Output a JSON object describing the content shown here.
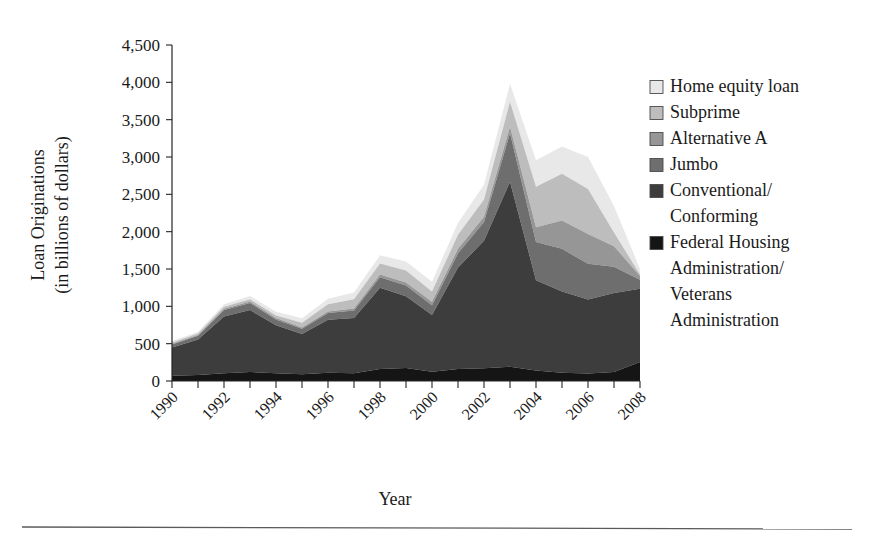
{
  "chart_data": {
    "type": "area",
    "stacked": true,
    "title": "",
    "xlabel": "Year",
    "ylabel": "Loan Originations\n(in billions of dollars)",
    "ylabel_line1": "Loan Originations",
    "ylabel_line2": "(in billions of dollars)",
    "xlim": [
      1990,
      2008
    ],
    "ylim": [
      0,
      4500
    ],
    "ytick_step": 500,
    "grid": false,
    "legend_position": "right",
    "x": [
      1990,
      1991,
      1992,
      1993,
      1994,
      1995,
      1996,
      1997,
      1998,
      1999,
      2000,
      2001,
      2002,
      2003,
      2004,
      2005,
      2006,
      2007,
      2008
    ],
    "xticks": [
      1990,
      1992,
      1994,
      1996,
      1998,
      2000,
      2002,
      2004,
      2006,
      2008
    ],
    "yticks": [
      0,
      500,
      1000,
      1500,
      2000,
      2500,
      3000,
      3500,
      4000,
      4500
    ],
    "ytick_labels": [
      "0",
      "500",
      "1,000",
      "1,500",
      "2,000",
      "2,500",
      "3,000",
      "3,500",
      "4,000",
      "4,500"
    ],
    "xtick_labels": [
      "1990",
      "1992",
      "1994",
      "1996",
      "1998",
      "2000",
      "2002",
      "2004",
      "2006",
      "2008"
    ],
    "stack_order_bottom_to_top": [
      "Federal Housing Administration/Veterans Administration",
      "Conventional/Conforming",
      "Jumbo",
      "Alternative A",
      "Subprime",
      "Home equity loan"
    ],
    "series": [
      {
        "name": "Federal Housing Administration/Veterans Administration",
        "legend_label_lines": [
          "Federal Housing",
          "Administration/",
          "Veterans",
          "Administration"
        ],
        "color": "#151515",
        "values": [
          70,
          80,
          105,
          120,
          105,
          90,
          110,
          105,
          160,
          175,
          125,
          160,
          170,
          190,
          140,
          110,
          100,
          120,
          255
        ]
      },
      {
        "name": "Conventional/Conforming",
        "legend_label_lines": [
          "Conventional/",
          "Conforming"
        ],
        "color": "#3d3d3d",
        "values": [
          380,
          475,
          760,
          830,
          640,
          540,
          710,
          740,
          1090,
          960,
          760,
          1360,
          1710,
          2480,
          1210,
          1090,
          990,
          1060,
          980
        ]
      },
      {
        "name": "Jumbo",
        "legend_label_lines": [
          "Jumbo"
        ],
        "color": "#6e6e6e",
        "values": [
          40,
          50,
          85,
          95,
          80,
          70,
          90,
          100,
          140,
          145,
          130,
          190,
          250,
          650,
          510,
          570,
          480,
          350,
          120
        ]
      },
      {
        "name": "Alternative A",
        "legend_label_lines": [
          "Alternative A"
        ],
        "color": "#969696",
        "values": [
          10,
          12,
          18,
          20,
          18,
          16,
          22,
          25,
          35,
          40,
          45,
          60,
          70,
          85,
          200,
          380,
          400,
          275,
          50
        ]
      },
      {
        "name": "Subprime",
        "legend_label_lines": [
          "Subprime"
        ],
        "color": "#bdbdbd",
        "values": [
          15,
          18,
          25,
          30,
          35,
          65,
          95,
          125,
          150,
          160,
          140,
          190,
          230,
          335,
          540,
          625,
          600,
          185,
          20
        ]
      },
      {
        "name": "Home equity loan",
        "legend_label_lines": [
          "Home equity loan"
        ],
        "color": "#e8e8e8",
        "values": [
          20,
          25,
          35,
          45,
          50,
          60,
          75,
          90,
          110,
          120,
          130,
          160,
          200,
          240,
          355,
          365,
          430,
          355,
          75
        ]
      }
    ],
    "totals": [
      535,
      660,
      1028,
      1140,
      928,
      841,
      1102,
      1185,
      1685,
      1600,
      1330,
      2120,
      2630,
      3980,
      2955,
      3140,
      3000,
      2345,
      1500
    ]
  },
  "legend": {
    "entries": [
      {
        "label": "Home equity loan",
        "color": "#e8e8e8"
      },
      {
        "label": "Subprime",
        "color": "#bdbdbd"
      },
      {
        "label": "Alternative A",
        "color": "#969696"
      },
      {
        "label": "Jumbo",
        "color": "#6e6e6e"
      },
      {
        "label": "Conventional/Conforming",
        "color": "#3d3d3d"
      },
      {
        "label": "Federal Housing Administration/Veterans Administration",
        "color": "#151515"
      }
    ]
  },
  "labels": {
    "x_axis_title": "Year",
    "y_axis_title_line1": "Loan Originations",
    "y_axis_title_line2": "(in billions of dollars)"
  }
}
